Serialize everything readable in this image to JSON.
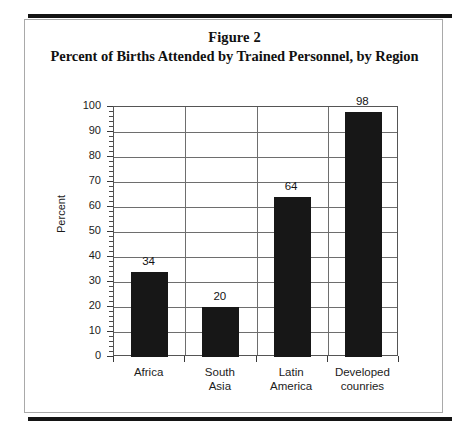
{
  "figure": {
    "title_line_1": "Figure 2",
    "title_line_2": "Percent of Births Attended by Trained Personnel, by Region"
  },
  "chart_data": {
    "type": "bar",
    "title": "Percent of Births Attended by Trained Personnel, by Region",
    "figure_label": "Figure 2",
    "categories": [
      "Africa",
      "South Asia",
      "Latin America",
      "Developed counries"
    ],
    "category_lines": [
      [
        "Africa"
      ],
      [
        "South",
        "Asia"
      ],
      [
        "Latin",
        "America"
      ],
      [
        "Developed",
        "counries"
      ]
    ],
    "values": [
      34,
      20,
      64,
      98
    ],
    "data_labels": [
      "34",
      "20",
      "64",
      "98"
    ],
    "xlabel": "",
    "ylabel": "Percent",
    "ylim": [
      0,
      100
    ],
    "ytick_interval": 10,
    "yticks": [
      0,
      10,
      20,
      30,
      40,
      50,
      60,
      70,
      80,
      90,
      100
    ],
    "ytick_labels": [
      "0",
      "10",
      "20",
      "30",
      "40",
      "50",
      "60",
      "70",
      "80",
      "90",
      "100"
    ],
    "yminor_interval": 2,
    "grid": "horizontal-and-vertical",
    "legend": "none",
    "bar_color": "#171717",
    "grid_color": "#6e6e6e",
    "axis_color": "#555555",
    "background_color": "#ffffff"
  }
}
